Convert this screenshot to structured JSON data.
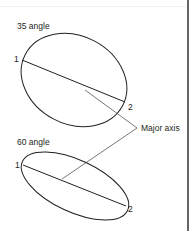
{
  "diagram": {
    "panels": [
      {
        "title": "35 angle",
        "point_start": "1",
        "point_end": "2"
      },
      {
        "title": "60 angle",
        "point_start": "1",
        "point_end": "2"
      }
    ],
    "callout": "Major axis"
  },
  "colors": {
    "stroke": "#231f20",
    "leader": "#555555",
    "border": "#333333",
    "background": "#ffffff"
  }
}
